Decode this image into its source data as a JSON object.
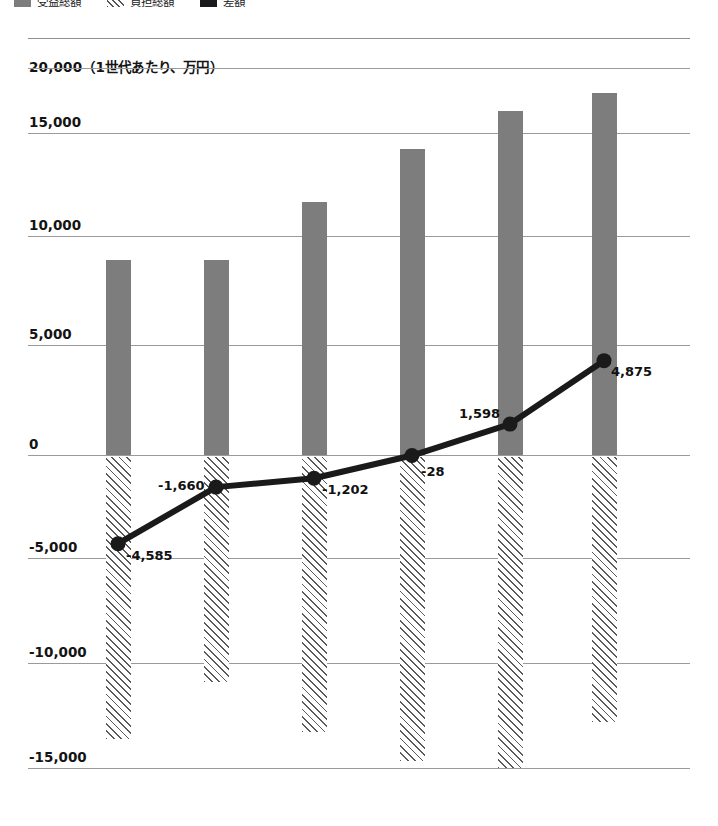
{
  "legend": {
    "items": [
      {
        "name": "benefit-total",
        "label": "受益総額",
        "style": "solid-gray",
        "color": "#7d7d7d"
      },
      {
        "name": "burden-total",
        "label": "負担総額",
        "style": "hatched",
        "color": "#ffffff"
      },
      {
        "name": "net-difference",
        "label": "差額",
        "style": "solid-black",
        "color": "#1a1a1a"
      }
    ]
  },
  "axis_caption": "20,000（1世代あたり、万円）",
  "chart_data": {
    "type": "bar",
    "title": "",
    "subtitle": "",
    "xlabel": "",
    "ylabel": "（1世代あたり、万円）",
    "ylim": [
      -15000,
      20000
    ],
    "grid": true,
    "legend_position": "top-left",
    "categories": [
      "",
      "",
      "",
      "",
      "",
      ""
    ],
    "ytick_labels": [
      "20,000",
      "15,000",
      "10,000",
      "5,000",
      "0",
      "-5,000",
      "-10,000",
      "-15,000"
    ],
    "ytick_values": [
      20000,
      15000,
      10000,
      5000,
      0,
      -5000,
      -10000,
      -15000
    ],
    "series": [
      {
        "name": "受益総額",
        "type": "bar",
        "color": "#7d7d7d",
        "values": [
          10100,
          10100,
          13100,
          15800,
          17800,
          18700
        ]
      },
      {
        "name": "負担総額",
        "type": "bar",
        "color": "#ffffff",
        "hatched": true,
        "values": [
          -14700,
          -11750,
          -14300,
          -15800,
          -16200,
          -13800
        ]
      },
      {
        "name": "差額",
        "type": "line",
        "color": "#1a1a1a",
        "values": [
          -4585,
          -1660,
          -1202,
          -28,
          1598,
          4875
        ],
        "labels": [
          "-4,585",
          "-1,660",
          "-1,202",
          "-28",
          "1,598",
          "4,875"
        ]
      }
    ]
  },
  "point_labels": [
    {
      "text": "-4,585",
      "x": 126,
      "y": 548
    },
    {
      "text": "-1,660",
      "x": 158,
      "y": 478
    },
    {
      "text": "-1,202",
      "x": 322,
      "y": 482
    },
    {
      "text": "-28",
      "x": 421,
      "y": 464
    },
    {
      "text": "1,598",
      "x": 459,
      "y": 406
    },
    {
      "text": "4,875",
      "x": 611,
      "y": 364
    }
  ]
}
